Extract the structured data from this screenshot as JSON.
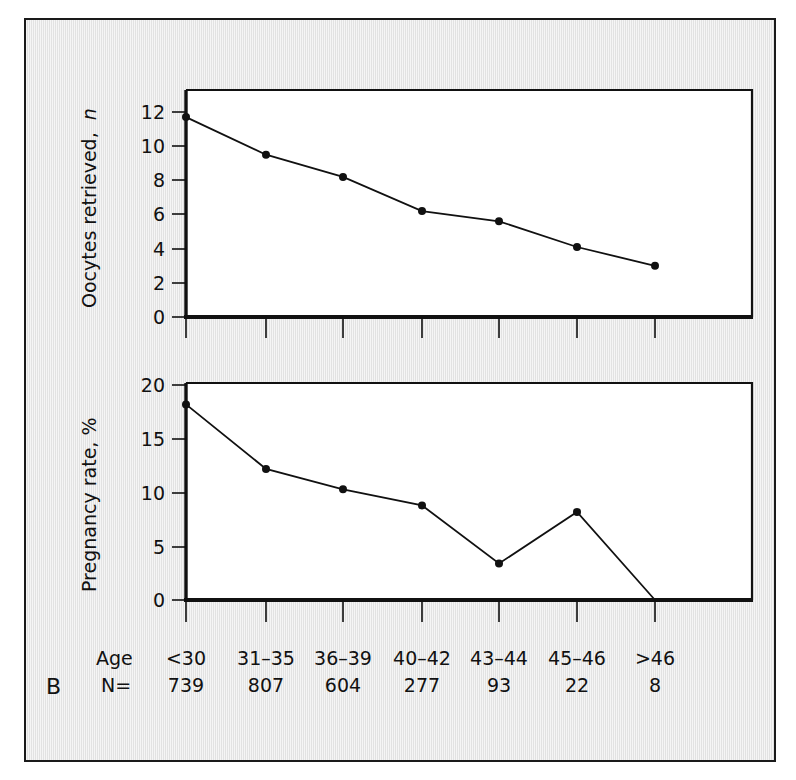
{
  "figure": {
    "panel_letter": "B",
    "background_color": "#e9e9e9",
    "line_color": "#111111",
    "frame_color": "#1a1a1a"
  },
  "table_rows": {
    "age_label": "Age",
    "n_label": "N="
  },
  "chart_data": [
    {
      "type": "line",
      "title": "",
      "xlabel": "Age",
      "ylabel": "Oocytes retrieved, n",
      "ylabel_plain": "Oocytes retrieved,",
      "ylabel_italic": "n",
      "categories": [
        "<30",
        "31–35",
        "36–39",
        "40–42",
        "43–44",
        "45–46",
        ">46"
      ],
      "values": [
        11.7,
        9.5,
        8.2,
        6.2,
        5.6,
        4.1,
        3.0
      ],
      "ylim": [
        0,
        13
      ],
      "yticks": [
        0,
        2,
        4,
        6,
        8,
        10,
        12
      ],
      "ytick_labels": [
        "0",
        "2",
        "4",
        "6",
        "8",
        "10",
        "12"
      ],
      "grid": false,
      "legend": "none",
      "markers": true
    },
    {
      "type": "line",
      "title": "",
      "xlabel": "Age",
      "ylabel": "Pregnancy rate, %",
      "categories": [
        "<30",
        "31–35",
        "36–39",
        "40–42",
        "43–44",
        "45–46",
        ">46"
      ],
      "values": [
        18.2,
        12.2,
        10.3,
        8.8,
        3.4,
        8.2,
        0.0
      ],
      "ylim": [
        0,
        20.5
      ],
      "yticks": [
        0,
        5,
        10,
        15,
        20
      ],
      "ytick_labels": [
        "0",
        "5",
        "10",
        "15",
        "20"
      ],
      "grid": false,
      "legend": "none",
      "markers": true,
      "marker_omitted_last": true
    }
  ],
  "sample_sizes": {
    "categories": [
      "<30",
      "31–35",
      "36–39",
      "40–42",
      "43–44",
      "45–46",
      ">46"
    ],
    "values": [
      "739",
      "807",
      "604",
      "277",
      "93",
      "22",
      "8"
    ]
  }
}
